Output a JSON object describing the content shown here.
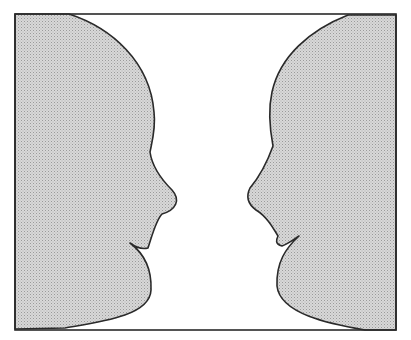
{
  "figure": {
    "colors": {
      "face_fill": "#d8d8d8",
      "face_dot": "#9a9a9a",
      "background": "#ffffff",
      "outline": "#2a2a2a"
    }
  }
}
